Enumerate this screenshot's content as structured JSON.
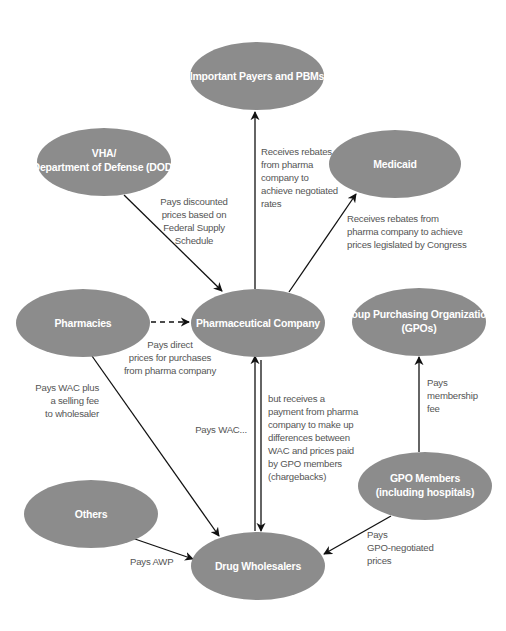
{
  "diagram": {
    "title": "",
    "node_color": "#8c8c8c",
    "edge_color": "#111111",
    "label_color": "#555555",
    "nodes": {
      "payers": {
        "lines": [
          "Important Payers and PBMs"
        ]
      },
      "vha": {
        "lines": [
          "VHA/",
          "Department of Defense (DOD)"
        ]
      },
      "medicaid": {
        "lines": [
          "Medicaid"
        ]
      },
      "pharmacies": {
        "lines": [
          "Pharmacies"
        ]
      },
      "pharma": {
        "lines": [
          "Pharmaceutical Company"
        ]
      },
      "gpos": {
        "lines": [
          "Group Purchasing Organizations",
          "(GPOs)"
        ]
      },
      "gpo_members": {
        "lines": [
          "GPO Members",
          "(including hospitals)"
        ]
      },
      "others": {
        "lines": [
          "Others"
        ]
      },
      "wholesalers": {
        "lines": [
          "Drug Wholesalers"
        ]
      }
    },
    "edges": {
      "pharma_to_payers": {
        "from": "Pharmaceutical Company",
        "to": "Important Payers and PBMs",
        "lines": [
          "Receives rebates",
          "from pharma",
          "company to",
          "achieve negotiated",
          "rates"
        ]
      },
      "vha_to_pharma": {
        "from": "VHA/Department of Defense (DOD)",
        "to": "Pharmaceutical Company",
        "lines": [
          "Pays discounted",
          "prices based on",
          "Federal Supply",
          "Schedule"
        ]
      },
      "pharma_to_medicaid": {
        "from": "Pharmaceutical Company",
        "to": "Medicaid",
        "lines": [
          "Receives rebates from",
          "pharma company to achieve",
          "prices legislated by Congress"
        ]
      },
      "pharmacies_to_pharma": {
        "from": "Pharmacies",
        "to": "Pharmaceutical Company",
        "style": "dashed",
        "lines": [
          "Pays direct",
          "prices for purchases",
          "from pharma company"
        ]
      },
      "pharmacies_to_wholesalers": {
        "from": "Pharmacies",
        "to": "Drug Wholesalers",
        "lines": [
          "Pays WAC plus",
          "a selling fee",
          "to wholesaler"
        ]
      },
      "wholesalers_to_pharma": {
        "from": "Drug Wholesalers",
        "to": "Pharmaceutical Company",
        "lines": [
          "Pays WAC..."
        ]
      },
      "pharma_to_wholesalers": {
        "from": "Pharmaceutical Company",
        "to": "Drug Wholesalers",
        "lines": [
          "but receives a",
          "payment from pharma",
          "company to make up",
          "differences between",
          "WAC and prices paid",
          "by GPO members",
          "(chargebacks)"
        ]
      },
      "members_to_gpos": {
        "from": "GPO Members (including hospitals)",
        "to": "Group Purchasing Organizations (GPOs)",
        "lines": [
          "Pays",
          "membership",
          "fee"
        ]
      },
      "members_to_wholesalers": {
        "from": "GPO Members (including hospitals)",
        "to": "Drug Wholesalers",
        "lines": [
          "Pays",
          "GPO-negotiated",
          "prices"
        ]
      },
      "others_to_wholesalers": {
        "from": "Others",
        "to": "Drug Wholesalers",
        "lines": [
          "Pays AWP"
        ]
      }
    }
  }
}
